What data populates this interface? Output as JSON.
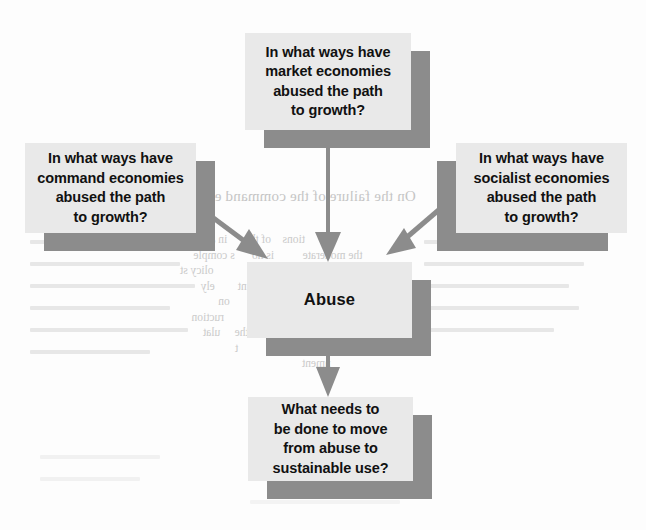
{
  "diagram": {
    "colors": {
      "box_fill": "#e9e9e9",
      "box_shadow": "#8c8c8c",
      "arrow": "#8c8c8c",
      "text": "#111111",
      "page_background": "#fdfdfd"
    },
    "nodes": [
      {
        "id": "market",
        "label": "In what ways have\nmarket economies\nabused the path\nto growth?",
        "shadow_side": "right"
      },
      {
        "id": "command",
        "label": "In what ways have\ncommand economies\nabused the path\nto growth?",
        "shadow_side": "right"
      },
      {
        "id": "socialist",
        "label": "In what ways have\nsocialist economies\nabused the path\nto growth?",
        "shadow_side": "left"
      },
      {
        "id": "abuse",
        "label": "Abuse",
        "shadow_side": "right"
      },
      {
        "id": "solution",
        "label": "What needs to\nbe done to move\nfrom abuse to\nsustainable use?",
        "shadow_side": "right"
      }
    ],
    "edges": [
      {
        "id": "market-to-abuse",
        "from": "market",
        "to": "abuse",
        "direction": "down"
      },
      {
        "id": "command-to-abuse",
        "from": "command",
        "to": "abuse",
        "direction": "down-right"
      },
      {
        "id": "socialist-to-abuse",
        "from": "socialist",
        "to": "abuse",
        "direction": "down-left"
      },
      {
        "id": "abuse-to-solution",
        "from": "abuse",
        "to": "solution",
        "direction": "down"
      }
    ]
  },
  "background_bleed": {
    "heading": "On the failure of the command eco",
    "body": "                       tions    of the      in a m\n   the moderate          is no      s comple\n    use the           of     rket              olicy st\n       is for             ances      nt        ely\n        by           ut                       on\n         s        use the         of         ruction\n       ation        tion      n of the     ulat\n      the           of                     t\n              nment"
  }
}
